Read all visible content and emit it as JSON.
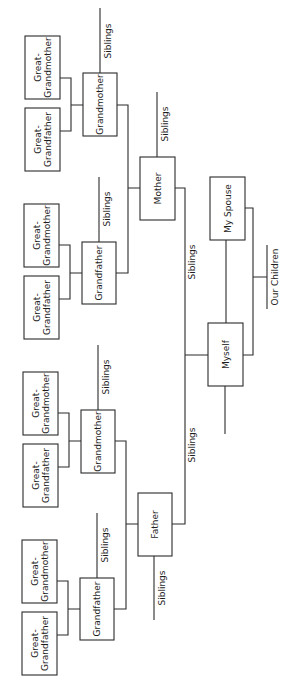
{
  "diagram": {
    "type": "family-tree",
    "orientation": "rotated-90-ccw",
    "people": {
      "ggf1": "Great-\nGrandfather",
      "ggm1": "Great-\nGrandmother",
      "ggf2": "Great-\nGrandfather",
      "ggm2": "Great-\nGrandmother",
      "ggf3": "Great-\nGrandfather",
      "ggm3": "Great-\nGrandmother",
      "ggf4": "Great-\nGrandfather",
      "ggm4": "Great-\nGrandmother",
      "gm_maternal": "Grandmother",
      "gf_maternal": "Grandfather",
      "gm_paternal": "Grandmother",
      "gf_paternal": "Grandfather",
      "mother": "Mother",
      "father": "Father",
      "myself": "Myself",
      "spouse": "My Spouse"
    },
    "labels": {
      "great_line1": "Great-",
      "grandfather_line2": "Grandfather",
      "grandmother_line2": "Grandmother",
      "grandmother": "Grandmother",
      "grandfather": "Grandfather",
      "mother": "Mother",
      "father": "Father",
      "myself": "Myself",
      "spouse": "My Spouse",
      "siblings": "Siblings",
      "children": "Our Children"
    },
    "relationships": [
      {
        "parents": [
          "Great-Grandfather",
          "Great-Grandmother"
        ],
        "child": "Grandmother (maternal)"
      },
      {
        "parents": [
          "Great-Grandfather",
          "Great-Grandmother"
        ],
        "child": "Grandfather (maternal)"
      },
      {
        "parents": [
          "Great-Grandfather",
          "Great-Grandmother"
        ],
        "child": "Grandmother (paternal)"
      },
      {
        "parents": [
          "Great-Grandfather",
          "Great-Grandmother"
        ],
        "child": "Grandfather (paternal)"
      },
      {
        "parents": [
          "Grandfather",
          "Grandmother"
        ],
        "child": "Mother"
      },
      {
        "parents": [
          "Grandfather",
          "Grandmother"
        ],
        "child": "Father"
      },
      {
        "parents": [
          "Father",
          "Mother"
        ],
        "child": "Myself"
      },
      {
        "parents": [
          "Myself",
          "My Spouse"
        ],
        "child": "Our Children"
      }
    ]
  }
}
